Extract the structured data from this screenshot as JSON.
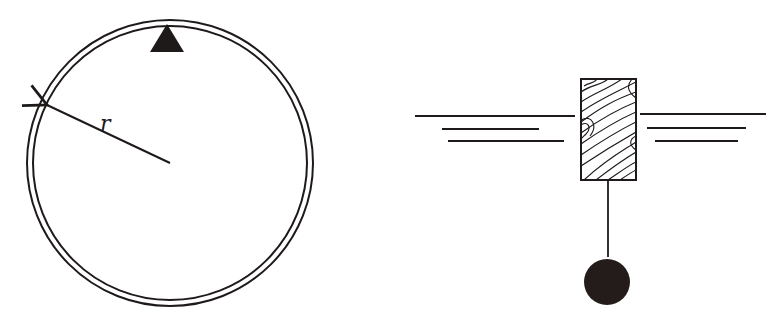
{
  "diagram": {
    "left_figure": {
      "description": "circular ring with marker at top",
      "radius_label": "r",
      "center": [
        170,
        163
      ],
      "outer_radius": 143,
      "inner_radius": 137,
      "marker": {
        "shape": "triangle",
        "apex": [
          167,
          24
        ],
        "base": [
          [
            150,
            52
          ],
          [
            184,
            52
          ]
        ]
      },
      "radius_line": {
        "from": [
          170,
          163
        ],
        "to": [
          46,
          105
        ]
      }
    },
    "right_figure": {
      "description": "wooden float block at water surface with hanging weight",
      "block": {
        "x": 581,
        "y": 79,
        "width": 55,
        "height": 101,
        "hatch": "wood-grain"
      },
      "water_lines_left": [
        {
          "y": 116,
          "x1": 415,
          "x2": 575
        },
        {
          "y": 129,
          "x1": 442,
          "x2": 539
        },
        {
          "y": 141,
          "x1": 448,
          "x2": 564
        }
      ],
      "water_lines_right": [
        {
          "y": 114,
          "x1": 640,
          "x2": 766
        },
        {
          "y": 128,
          "x1": 647,
          "x2": 746
        },
        {
          "y": 141,
          "x1": 655,
          "x2": 738
        }
      ],
      "string": {
        "x": 608,
        "y1": 180,
        "y2": 257
      },
      "ball": {
        "cx": 607,
        "cy": 282,
        "r": 23
      }
    },
    "colors": {
      "ink": "#1e1a1a",
      "background": "#ffffff"
    }
  }
}
